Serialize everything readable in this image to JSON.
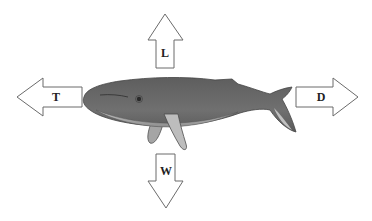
{
  "diagram": {
    "colors": {
      "background": "#ffffff",
      "arrow_stroke": "#6b6b6b",
      "arrow_fill": "#ffffff",
      "whale_body": "#6a6a6a",
      "whale_belly": "#b8b8b8",
      "whale_fin": "#9a9a9a",
      "label": "#222222"
    },
    "arrows": {
      "lift": {
        "label": "L",
        "direction": "up"
      },
      "thrust": {
        "label": "T",
        "direction": "left"
      },
      "drag": {
        "label": "D",
        "direction": "right"
      },
      "weight": {
        "label": "W",
        "direction": "down"
      }
    }
  }
}
